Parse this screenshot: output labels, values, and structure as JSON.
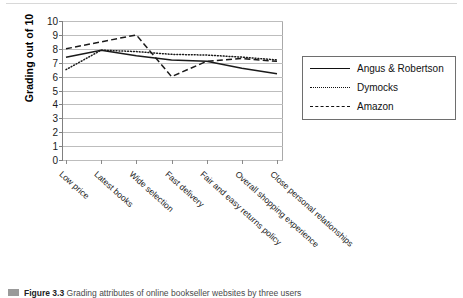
{
  "chart_data": {
    "type": "line",
    "title": "",
    "xlabel": "",
    "ylabel": "Grading out of 10",
    "ylim": [
      0,
      10
    ],
    "yticks": [
      0,
      1,
      2,
      3,
      4,
      5,
      6,
      7,
      8,
      9,
      10
    ],
    "grid": true,
    "legend_position": "right",
    "categories": [
      "Low price",
      "Latest books",
      "Wide selection",
      "Fast delivery",
      "Fair and easy returns policy",
      "Overall shopping experience",
      "Close personal relationships"
    ],
    "series": [
      {
        "name": "Angus & Robertson",
        "style": "solid",
        "color": "#1a1a1a",
        "values": [
          7.4,
          7.9,
          7.5,
          7.2,
          7.1,
          6.6,
          6.2
        ]
      },
      {
        "name": "Dymocks",
        "style": "dotted",
        "color": "#1a1a1a",
        "values": [
          6.5,
          7.9,
          7.8,
          7.6,
          7.55,
          7.4,
          7.2
        ]
      },
      {
        "name": "Amazon",
        "style": "dashed",
        "color": "#1a1a1a",
        "values": [
          8.0,
          8.5,
          9.0,
          6.0,
          7.1,
          7.3,
          7.1
        ]
      }
    ]
  },
  "y_axis": {
    "title": "Grading out of 10",
    "tick_labels": [
      "10",
      "9",
      "8",
      "7",
      "6",
      "5",
      "4",
      "3",
      "2",
      "1",
      "0"
    ]
  },
  "x_axis": {
    "tick_labels": [
      "Low price",
      "Latest books",
      "Wide selection",
      "Fast delivery",
      "Fair and easy returns policy",
      "Overall shopping experience",
      "Close personal relationships"
    ]
  },
  "legend": {
    "entries": [
      {
        "label": "Angus & Robertson",
        "style": "solid"
      },
      {
        "label": "Dymocks",
        "style": "dotted"
      },
      {
        "label": "Amazon",
        "style": "dashed"
      }
    ]
  },
  "caption": {
    "figure_label": "Figure 3.3",
    "text": "Grading attributes of online bookseller websites by three users"
  }
}
